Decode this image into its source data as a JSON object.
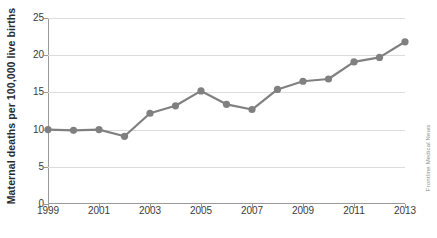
{
  "chart_data": {
    "type": "line",
    "title": "",
    "xlabel": "",
    "ylabel": "Maternal deaths per 100,000 live births",
    "x": [
      1999,
      2000,
      2001,
      2002,
      2003,
      2004,
      2005,
      2006,
      2007,
      2008,
      2009,
      2010,
      2011,
      2012,
      2013
    ],
    "values": [
      10.0,
      9.9,
      10.0,
      9.1,
      12.2,
      13.2,
      15.2,
      13.4,
      12.7,
      15.4,
      16.5,
      16.8,
      19.1,
      19.7,
      21.8
    ],
    "series": [
      {
        "name": "Maternal mortality rate",
        "values": [
          10.0,
          9.9,
          10.0,
          9.1,
          12.2,
          13.2,
          15.2,
          13.4,
          12.7,
          15.4,
          16.5,
          16.8,
          19.1,
          19.7,
          21.8
        ],
        "color": "#808080"
      }
    ],
    "xlim": [
      1999,
      2013
    ],
    "ylim": [
      0,
      25
    ],
    "y_ticks": [
      0,
      5,
      10,
      15,
      20,
      25
    ],
    "y_tick_labels": [
      "0",
      "5",
      "10",
      "15",
      "20",
      "25"
    ],
    "x_ticks": [
      1999,
      2001,
      2003,
      2005,
      2007,
      2009,
      2011,
      2013
    ],
    "x_tick_labels": [
      "1999",
      "2001",
      "2003",
      "2005",
      "2007",
      "2009",
      "2011",
      "2013"
    ],
    "grid": true,
    "grid_axis": "y",
    "legend": false,
    "legend_position": "none",
    "marker": "circle",
    "line_color": "#808080",
    "marker_color": "#808080",
    "grid_color": "#dcdcdc",
    "axis_color": "#9a9a9a",
    "background": "#ffffff"
  },
  "watermark": {
    "text": "Frontline Medical News",
    "color": "#8d8d8d"
  }
}
